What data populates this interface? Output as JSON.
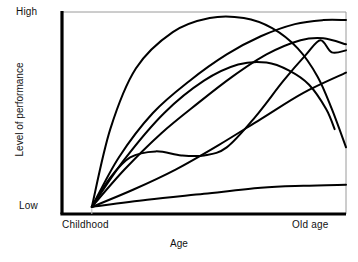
{
  "chart_data": {
    "type": "line",
    "title": "",
    "subtitle": "",
    "xlabel": "Age",
    "ylabel": "Level of performance",
    "x_tick_labels": [
      "Childhood",
      "Old age"
    ],
    "y_tick_labels": [
      "Low",
      "High"
    ],
    "xlim": [
      0,
      1
    ],
    "ylim": [
      0,
      1
    ],
    "grid": false,
    "legend": "none",
    "frame": "box",
    "line_color": "#000000",
    "line_width_px": 2,
    "background": "#ffffff",
    "annotation": "Six to seven idealised developmental trajectories of performance across the lifespan, all originating from a single common point at childhood/low performance and fanning out; several converge again near old age.",
    "origin_point": {
      "x": 0.105,
      "y": 0.035
    },
    "convergence_point": {
      "x": 0.92,
      "y": 0.59
    },
    "series": [
      {
        "name": "steep-early-rise-then-decline",
        "description": "Rises very steeply in childhood to near-maximum, plateaus across adulthood, then declines in old age",
        "x": [
          0.105,
          0.17,
          0.26,
          0.39,
          0.52,
          0.64,
          0.74,
          0.83,
          0.9,
          0.95,
          1.0
        ],
        "y": [
          0.035,
          0.42,
          0.72,
          0.9,
          0.97,
          0.97,
          0.92,
          0.82,
          0.68,
          0.52,
          0.33
        ]
      },
      {
        "name": "gradual-rise-to-high-plateau",
        "description": "Smooth sustained rise reaching the ceiling late and holding it to old age",
        "x": [
          0.105,
          0.2,
          0.32,
          0.45,
          0.58,
          0.7,
          0.82,
          0.92,
          1.0
        ],
        "y": [
          0.035,
          0.28,
          0.5,
          0.66,
          0.79,
          0.88,
          0.94,
          0.96,
          0.96
        ]
      },
      {
        "name": "late-accelerating-rise",
        "description": "Slow start then accelerating growth, crossing other curves and peaking at old age",
        "x": [
          0.105,
          0.22,
          0.35,
          0.48,
          0.6,
          0.72,
          0.84,
          0.92,
          1.0
        ],
        "y": [
          0.035,
          0.22,
          0.4,
          0.55,
          0.68,
          0.79,
          0.86,
          0.87,
          0.84
        ]
      },
      {
        "name": "mid-peak-then-decline",
        "description": "Rises to a mid-to-late peak then falls away steeply after the convergence point",
        "x": [
          0.105,
          0.22,
          0.36,
          0.5,
          0.62,
          0.72,
          0.8,
          0.87,
          0.93,
          0.96
        ],
        "y": [
          0.035,
          0.27,
          0.5,
          0.66,
          0.74,
          0.75,
          0.71,
          0.64,
          0.52,
          0.42
        ]
      },
      {
        "name": "plateau-dip-then-rise",
        "description": "Early rise to a low plateau with a slight dip in middle childhood/adulthood, then renewed rise to a late bump",
        "x": [
          0.105,
          0.17,
          0.24,
          0.33,
          0.42,
          0.5,
          0.58,
          0.68,
          0.78,
          0.86,
          0.91,
          0.95,
          1.0
        ],
        "y": [
          0.035,
          0.18,
          0.28,
          0.31,
          0.29,
          0.29,
          0.33,
          0.48,
          0.66,
          0.79,
          0.86,
          0.8,
          0.81
        ]
      },
      {
        "name": "slow-steady-rise",
        "description": "Shallow but continuous near-linear increase across the whole lifespan",
        "x": [
          0.105,
          0.25,
          0.4,
          0.55,
          0.7,
          0.85,
          1.0
        ],
        "y": [
          0.035,
          0.12,
          0.22,
          0.34,
          0.47,
          0.6,
          0.7
        ]
      },
      {
        "name": "near-flat-minimal-gain",
        "description": "Very small gain from childhood, remaining close to the low end throughout",
        "x": [
          0.105,
          0.3,
          0.5,
          0.7,
          0.85,
          1.0
        ],
        "y": [
          0.035,
          0.07,
          0.1,
          0.13,
          0.14,
          0.145
        ]
      }
    ]
  },
  "labels": {
    "y_high": "High",
    "y_low": "Low",
    "x_childhood": "Childhood",
    "x_old_age": "Old age",
    "x_axis_title": "Age",
    "y_axis_title": "Level of performance"
  }
}
